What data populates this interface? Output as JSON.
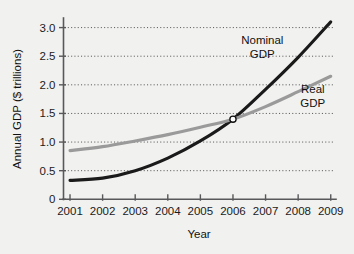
{
  "chart_data": {
    "type": "line",
    "title": "",
    "xlabel": "Year",
    "ylabel": "Annual GDP ($ trillions)",
    "x": [
      2001,
      2002,
      2003,
      2004,
      2005,
      2006,
      2007,
      2008,
      2009
    ],
    "xtick_labels": [
      "2001",
      "2002",
      "2003",
      "2004",
      "2005",
      "2006",
      "2007",
      "2008",
      "2009"
    ],
    "ytick_labels": [
      "0",
      "0.5",
      "1.0",
      "1.5",
      "2.0",
      "2.5",
      "3.0"
    ],
    "ytick_values": [
      0,
      0.5,
      1.0,
      1.5,
      2.0,
      2.5,
      3.0
    ],
    "xlim": [
      2000.8,
      2009.1
    ],
    "ylim": [
      0,
      3.15
    ],
    "grid": "horizontal-dotted",
    "legend": "inline-annotations",
    "series": [
      {
        "name": "Nominal GDP",
        "color": "#1a1a1a",
        "width": 3.1,
        "values": [
          0.33,
          0.37,
          0.5,
          0.72,
          1.02,
          1.4,
          1.92,
          2.48,
          3.1
        ]
      },
      {
        "name": "Real GDP",
        "color": "#9a9a9a",
        "width": 3.1,
        "values": [
          0.85,
          0.92,
          1.02,
          1.13,
          1.26,
          1.4,
          1.62,
          1.88,
          2.15
        ]
      }
    ],
    "annotations": [
      {
        "text_line1": "Nominal",
        "text_line2": "GDP",
        "x": 2006.9,
        "y": 2.72
      },
      {
        "text_line1": "Real",
        "text_line2": "GDP",
        "x": 2008.45,
        "y": 1.86
      }
    ],
    "markers": [
      {
        "name": "intersection-point",
        "x": 2006,
        "y": 1.4,
        "style": "open-circle",
        "fill": "#ffffff"
      }
    ]
  },
  "colors": {
    "background": "#f1f1ef",
    "axis": "#58585a",
    "grid": "#5d5d5f",
    "nominal": "#1a1a1a",
    "real": "#9a9a9a",
    "text": "#111111"
  }
}
